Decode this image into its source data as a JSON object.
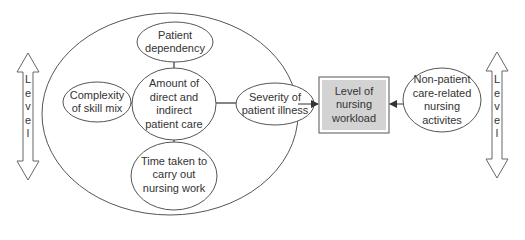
{
  "diagram": {
    "type": "concept-map",
    "colors": {
      "stroke": "#555555",
      "box_fill": "#d3d3d3",
      "box_border": "#666666",
      "text": "#333333",
      "background": "#ffffff"
    },
    "outer_group": {
      "shape": "ellipse",
      "nodes": {
        "top": {
          "lines": [
            "Patient",
            "dependency"
          ]
        },
        "center": {
          "lines": [
            "Amount of",
            "direct and",
            "indirect",
            "patient care"
          ]
        },
        "left": {
          "lines": [
            "Complexity",
            "of skill mix"
          ]
        },
        "right": {
          "lines": [
            "Severity of",
            "patient illness"
          ]
        },
        "bottom": {
          "lines": [
            "Time taken to",
            "carry out",
            "nursing work"
          ]
        }
      }
    },
    "target": {
      "lines": [
        "Level of",
        "nursing",
        "workload"
      ]
    },
    "external_node": {
      "lines": [
        "Non-patient",
        "care-related",
        "nursing",
        "activites"
      ]
    },
    "left_level_arrow": {
      "letters": [
        "L",
        "e",
        "v",
        "e",
        "l"
      ]
    },
    "right_level_arrow": {
      "letters": [
        "L",
        "e",
        "v",
        "e",
        "l"
      ]
    },
    "edges": [
      {
        "from": "outer_group",
        "to": "target",
        "arrow": true
      },
      {
        "from": "external_node",
        "to": "target",
        "arrow": true
      },
      {
        "from": "top",
        "to": "center",
        "arrow": false
      },
      {
        "from": "left",
        "to": "center",
        "arrow": false
      },
      {
        "from": "right",
        "to": "center",
        "arrow": false
      },
      {
        "from": "bottom",
        "to": "center",
        "arrow": false
      }
    ]
  }
}
